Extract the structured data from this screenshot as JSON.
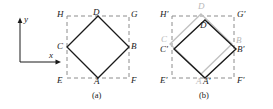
{
  "figure": {
    "caption_a": "(a)",
    "caption_b": "(b)",
    "axes": {
      "x_label": "x",
      "y_label": "y"
    },
    "colors": {
      "solid": "#1a1a1a",
      "dashed": "#8c8c8c",
      "ghost": "#c0c0c0",
      "background": "#ffffff"
    },
    "panel_a": {
      "square_labels": {
        "top_left": "H",
        "top_right": "G",
        "bottom_left": "E",
        "bottom_right": "F"
      },
      "diamond_labels": {
        "top": "D",
        "right": "B",
        "bottom": "A",
        "left": "C"
      }
    },
    "panel_b": {
      "square_labels": {
        "top_left": "H'",
        "top_right": "G'",
        "bottom_left": "E'",
        "bottom_right": "F'"
      },
      "diamond_labels": {
        "top": "D'",
        "right": "B'",
        "bottom": "A'",
        "left": "C'"
      },
      "ghost_diamond_labels": {
        "top": "D",
        "right": "B",
        "bottom": "A",
        "left": "C"
      }
    }
  },
  "geometry": {
    "panel_a": {
      "square": {
        "x": 67,
        "y": 16,
        "w": 62,
        "h": 62
      },
      "diamond": [
        [
          98,
          16
        ],
        [
          129,
          47
        ],
        [
          98,
          78
        ],
        [
          67,
          47
        ]
      ]
    },
    "panel_b": {
      "square": {
        "x": 172,
        "y": 16,
        "w": 62,
        "h": 62
      },
      "diamond_primed": [
        [
          205,
          20
        ],
        [
          236,
          49
        ],
        [
          205,
          78
        ],
        [
          174,
          49
        ]
      ],
      "diamond_ghost": [
        [
          201,
          15
        ],
        [
          232,
          45
        ],
        [
          201,
          75
        ],
        [
          170,
          45
        ]
      ]
    },
    "axes": {
      "origin": [
        20,
        62
      ],
      "y_tip": [
        20,
        19
      ],
      "x_tip": [
        61,
        62
      ]
    }
  }
}
